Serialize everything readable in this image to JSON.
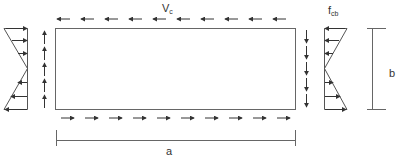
{
  "diagram": {
    "colors": {
      "stroke": "#555555",
      "arrow": "#333333",
      "background": "#ffffff"
    },
    "labels": {
      "shear": {
        "main": "V",
        "sub": "c"
      },
      "bending_stress": {
        "main": "f",
        "sub": "cb"
      },
      "width_dim": "a",
      "height_dim": "b"
    },
    "panel": {
      "x": 55,
      "y": 28,
      "width": 240,
      "height": 81
    },
    "shear_arrows": {
      "top": {
        "direction": "left",
        "count": 10
      },
      "bottom": {
        "direction": "right",
        "count": 10
      },
      "left": {
        "direction": "up",
        "count": 5
      },
      "right": {
        "direction": "down",
        "count": 5
      }
    },
    "stress_diagrams": {
      "left": {
        "top_arrows": "right",
        "bottom_arrows": "left"
      },
      "right": {
        "top_arrows": "left",
        "bottom_arrows": "right"
      }
    }
  }
}
